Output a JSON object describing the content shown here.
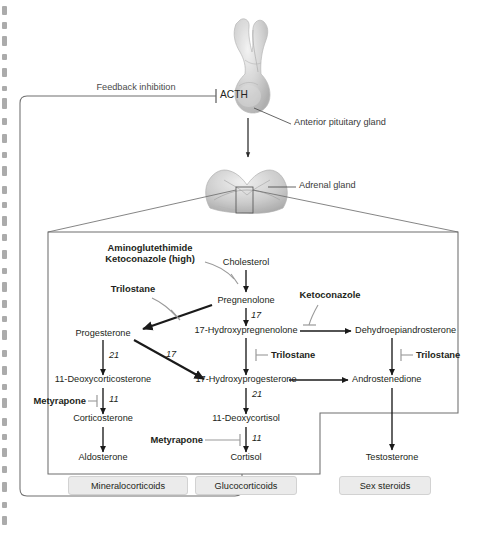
{
  "figure": {
    "feedback_label": "Feedback inhibition"
  },
  "anatomy": {
    "acth_label": "ACTH",
    "pituitary_callout": "Anterior pituitary gland",
    "adrenal_callout": "Adrenal gland"
  },
  "metabolites": {
    "cholesterol": "Cholesterol",
    "pregnenolone": "Pregnenolone",
    "hydroxypregnenolone": "17-Hydroxypregnenolone",
    "dhea": "Dehydroepiandrosterone",
    "progesterone": "Progesterone",
    "hydroxyprogesterone": "17-Hydroxyprogesterone",
    "androstenedione": "Androstenedione",
    "deoxycorticosterone": "11-Deoxycorticosterone",
    "deoxycortisol": "11-Deoxycortisol",
    "corticosterone": "Corticosterone",
    "cortisol": "Cortisol",
    "aldosterone": "Aldosterone",
    "testosterone": "Testosterone"
  },
  "enzymes": {
    "e17a": "17",
    "e17b": "17",
    "e21a": "21",
    "e21b": "21",
    "e11a": "11",
    "e11b": "11"
  },
  "drugs": {
    "aminoglutethimide": "Aminoglutethimide",
    "ketoconazole_high": "Ketoconazole (high)",
    "trilostane_left": "Trilostane",
    "ketoconazole": "Ketoconazole",
    "trilostane_mid": "Trilostane",
    "trilostane_right": "Trilostane",
    "metyrapone_left": "Metyrapone",
    "metyrapone_right": "Metyrapone"
  },
  "classes": [
    {
      "label": "Mineralocorticoids"
    },
    {
      "label": "Glucocorticoids"
    },
    {
      "label": "Sex steroids"
    }
  ],
  "colors": {
    "ink": "#231f20",
    "arrow_black": "#1a1a1a",
    "inhibitor_gray": "#9a9a9a",
    "box_stroke": "#6f6f6f",
    "class_fill": "#ebebeb",
    "class_stroke": "#d2d2d2",
    "gland_gray": "#b9b9b9"
  }
}
